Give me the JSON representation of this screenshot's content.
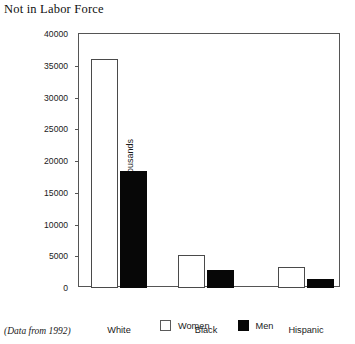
{
  "chart_data": {
    "type": "bar",
    "title": "Not in Labor Force",
    "xlabel": "",
    "ylabel": "Population in thousands",
    "categories": [
      "White",
      "Black",
      "Hispanic"
    ],
    "series": [
      {
        "name": "Women",
        "color": "#ffffff",
        "values": [
          36000,
          5200,
          3300
        ]
      },
      {
        "name": "Men",
        "color": "#070707",
        "values": [
          18500,
          2850,
          1400
        ]
      }
    ],
    "ylim": [
      0,
      40000
    ],
    "yticks": [
      0,
      5000,
      10000,
      15000,
      20000,
      25000,
      30000,
      35000,
      40000
    ],
    "ytick_labels": [
      "0",
      "5000",
      "10000",
      "15000",
      "20000",
      "25000",
      "30000",
      "35000",
      "40000"
    ],
    "grid": false,
    "legend_position": "bottom",
    "annotation": "(Data from 1992)"
  },
  "legend": {
    "entries": [
      {
        "label": "Women",
        "swatch": "white-square-swatch"
      },
      {
        "label": "Men",
        "swatch": "black-square-swatch"
      }
    ]
  },
  "footnote": "(Data from 1992)"
}
